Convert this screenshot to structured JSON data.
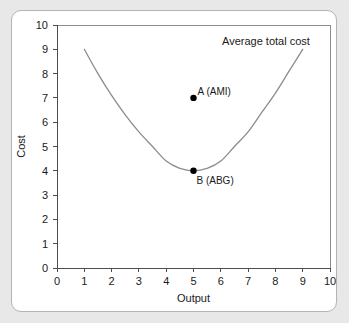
{
  "figure": {
    "background_color": "#e8e8e8",
    "card_color": "#ffffff",
    "card_border_color": "#b4b4b4"
  },
  "chart_data": {
    "type": "line",
    "title": "",
    "xlabel": "Output",
    "ylabel": "Cost",
    "xlim": [
      0,
      10
    ],
    "ylim": [
      0,
      10
    ],
    "grid": false,
    "legend_position": "inline-upper-right",
    "xticks": [
      "0",
      "1",
      "2",
      "3",
      "4",
      "5",
      "6",
      "7",
      "8",
      "9",
      "10"
    ],
    "yticks": [
      "0",
      "1",
      "2",
      "3",
      "4",
      "5",
      "6",
      "7",
      "8",
      "9",
      "10"
    ],
    "series": [
      {
        "name": "Average total cost",
        "label": "Average total cost",
        "color": "#8c8c8c",
        "x": [
          1.0,
          1.5,
          2.0,
          2.5,
          3.0,
          3.5,
          4.0,
          4.5,
          5.0,
          5.5,
          6.0,
          6.5,
          7.0,
          7.5,
          8.0,
          8.5,
          9.0
        ],
        "y": [
          9.0,
          8.0,
          7.1,
          6.3,
          5.6,
          5.0,
          4.4,
          4.1,
          4.0,
          4.1,
          4.4,
          5.0,
          5.6,
          6.4,
          7.2,
          8.1,
          9.0
        ]
      }
    ],
    "annotations": [
      {
        "name": "point-a",
        "label": "A (AMI)",
        "x": 5,
        "y": 7,
        "label_dx": 4,
        "label_dy": -3,
        "anchor": "start"
      },
      {
        "name": "point-b",
        "label": "B (ABG)",
        "x": 5,
        "y": 4,
        "label_dx": 3,
        "label_dy": 13,
        "anchor": "start"
      }
    ]
  }
}
